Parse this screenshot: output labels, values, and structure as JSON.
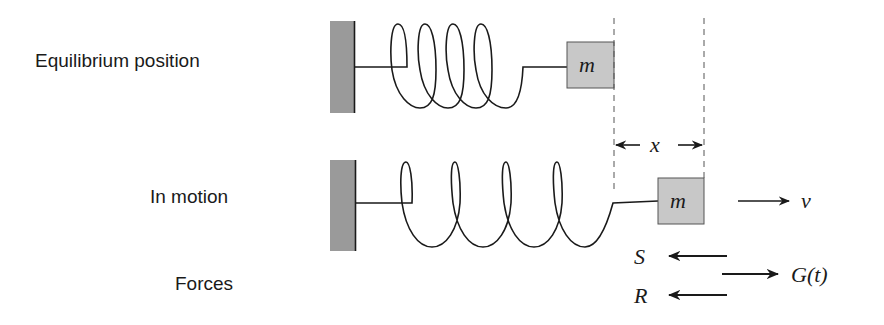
{
  "labels": {
    "equilibrium": "Equilibrium position",
    "in_motion": "In motion",
    "forces": "Forces"
  },
  "symbols": {
    "mass_top": "m",
    "mass_bottom": "m",
    "displacement": "x",
    "velocity": "v",
    "spring_force": "S",
    "resistance_force": "R",
    "external_force": "G(t)"
  },
  "colors": {
    "wall": "#9a9a9a",
    "mass_fill": "#c8c8c8",
    "stroke": "#1a1a1a"
  }
}
